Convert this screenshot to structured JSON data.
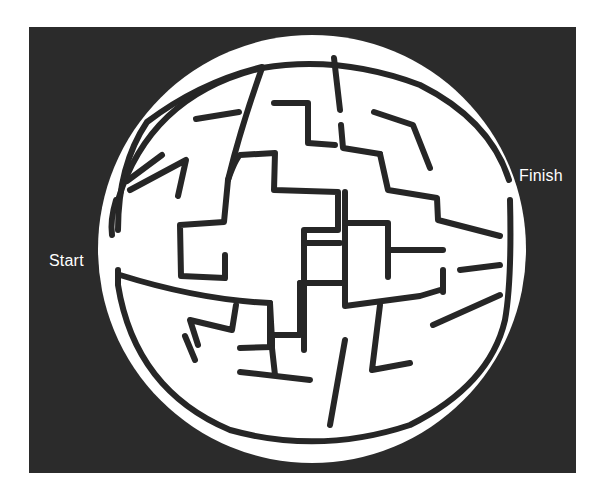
{
  "puzzle": {
    "type": "maze",
    "shape": "sphere-globe",
    "start_label": "Start",
    "finish_label": "Finish"
  },
  "colors": {
    "background": "#2b2b2b",
    "disc": "#ffffff",
    "walls": "#262626",
    "label": "#ffffff",
    "page": "#ffffff"
  },
  "board": {
    "x": 29,
    "y": 27,
    "width": 547,
    "height": 446
  },
  "disc": {
    "cx": 312,
    "cy": 249,
    "r": 214
  },
  "walls": [
    "M 118 200 Q 150 95 262 68 Q 340 55 420 85 Q 490 120 509 180",
    "M 118 270 L 118 285 Q 135 390 230 430 Q 320 455 410 425 Q 490 385 505 320 Q 512 280 510 200",
    "M 118 230 Q 118 165 147 122 Q 200 82 262 67",
    "M 112 235 Q 110 220 116 200",
    "M 120 275 Q 200 300 270 303 L 271 322 L 272 340",
    "M 162 155 L 127 181",
    "M 130 190 L 186 160 L 178 196",
    "M 196 119 L 239 112",
    "M 262 68 Q 240 130 228 180 L 224 222 L 180 225 L 181 276 L 225 278 L 225 255",
    "M 228 180 Q 235 160 240 155 L 275 153 L 274 190 L 338 192 L 338 230 L 304 230 L 304 350",
    "M 274 103 L 308 103 L 308 143 L 335 145",
    "M 334 58 L 340 110",
    "M 341 125 L 343 148 L 380 154",
    "M 374 112 L 413 125 L 430 168",
    "M 380 154 L 388 190 L 437 198 L 438 220 L 500 236",
    "M 304 243 L 310 243",
    "M 304 243 L 340 243",
    "M 345 192 L 345 306 L 420 296 L 440 290",
    "M 346 223 L 388 223 L 388 277",
    "M 390 250 L 443 250",
    "M 443 270 L 443 292",
    "M 460 270 L 500 265",
    "M 433 325 L 500 295",
    "M 270 303 L 270 345",
    "M 236 305 L 232 330 L 190 320 L 198 345",
    "M 300 283 L 300 335 L 272 335 L 272 347 L 240 348",
    "M 240 372 L 310 380",
    "M 272 348 L 275 375",
    "M 345 340 L 330 425",
    "M 380 305 L 372 370 L 410 363",
    "M 300 283 L 345 283",
    "M 185 336 L 195 360"
  ]
}
